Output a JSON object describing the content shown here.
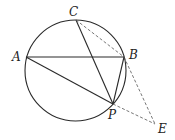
{
  "diagram": {
    "title": "",
    "circle": {
      "cx": 75.5,
      "cy": 70.5,
      "r": 50.5
    },
    "points": {
      "A": {
        "x": 26,
        "y": 57,
        "label": "A"
      },
      "B": {
        "x": 124,
        "y": 57,
        "label": "B"
      },
      "C": {
        "x": 76,
        "y": 20,
        "label": "C"
      },
      "P": {
        "x": 113,
        "y": 104,
        "label": "P"
      },
      "E": {
        "x": 155,
        "y": 124,
        "label": "E"
      }
    },
    "solid_segments": [
      "AB",
      "AP",
      "CP",
      "BP"
    ],
    "dashed_segments": [
      "CB",
      "BE",
      "PE"
    ],
    "labels": {
      "A": "A",
      "B": "B",
      "C": "C",
      "P": "P",
      "E": "E"
    }
  }
}
